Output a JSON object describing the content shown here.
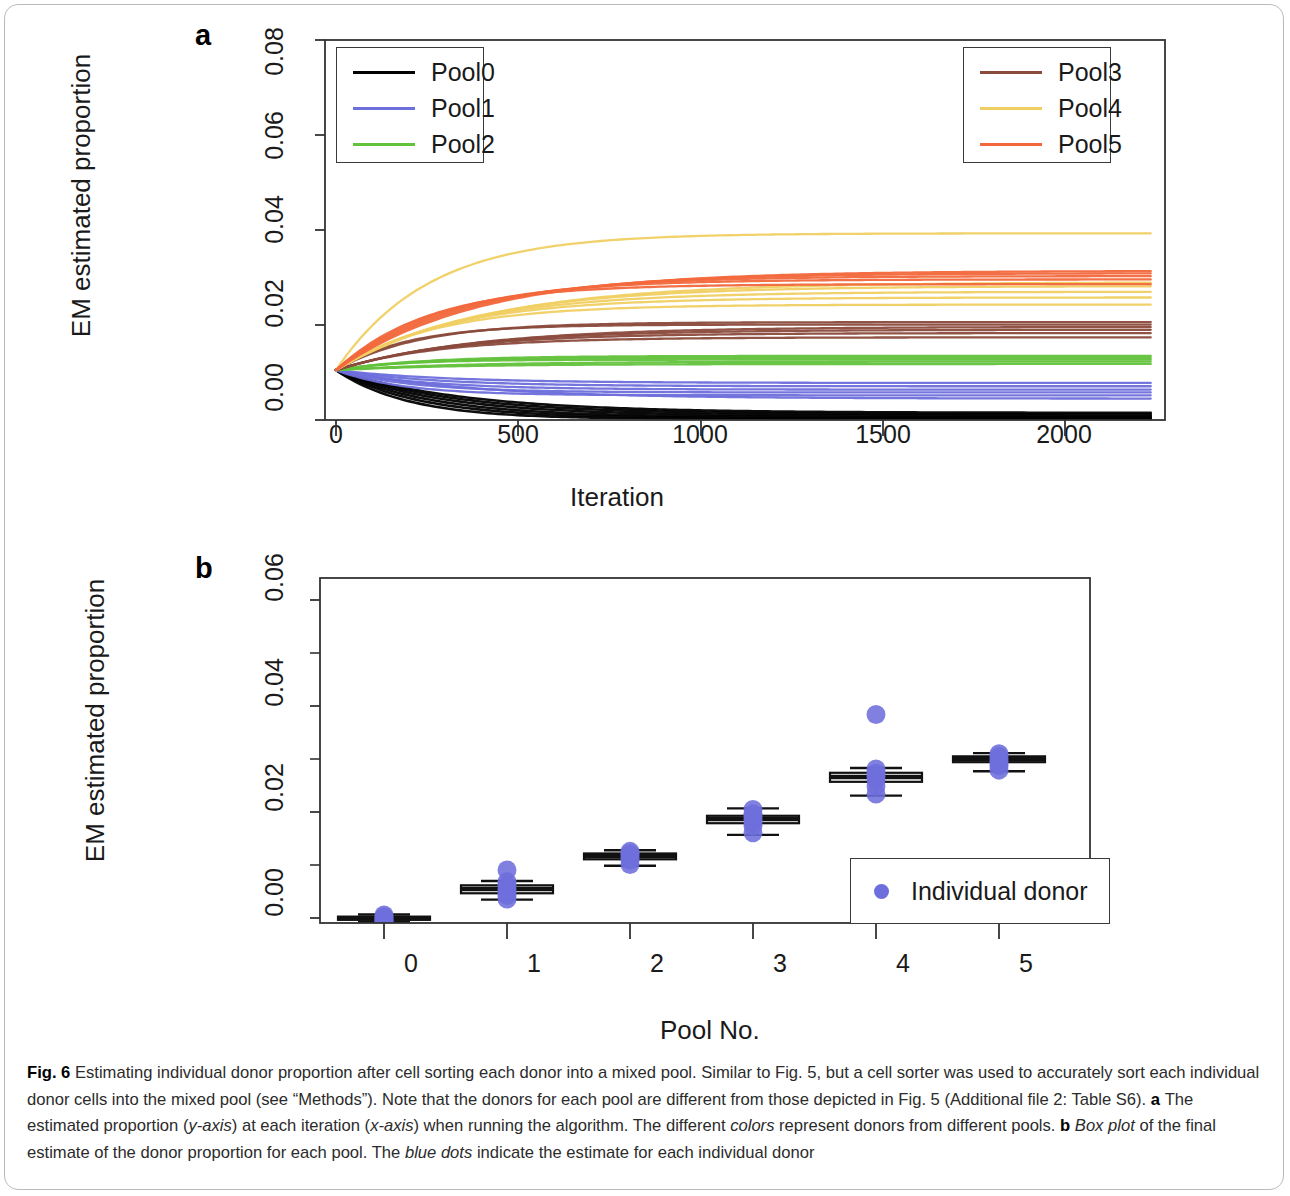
{
  "figure": {
    "label": "Fig. 6",
    "caption_parts": [
      {
        "text": "Fig. 6 ",
        "style": "bold"
      },
      {
        "text": "Estimating individual donor proportion after cell sorting each donor into a mixed pool. Similar to Fig. 5, but a cell sorter was used to accurately sort each individual donor cells into the mixed pool (see “Methods”). Note that the donors for each pool are different from those depicted in Fig. 5 (Additional file 2: Table S6). ",
        "style": "normal"
      },
      {
        "text": "a ",
        "style": "bold"
      },
      {
        "text": "The estimated proportion (",
        "style": "normal"
      },
      {
        "text": "y-axis",
        "style": "italic"
      },
      {
        "text": ") at each iteration (",
        "style": "normal"
      },
      {
        "text": "x-axis",
        "style": "italic"
      },
      {
        "text": ") when running the algorithm. The different ",
        "style": "normal"
      },
      {
        "text": "colors",
        "style": "italic"
      },
      {
        "text": " represent donors from different pools. ",
        "style": "normal"
      },
      {
        "text": "b ",
        "style": "bold"
      },
      {
        "text": "Box plot",
        "style": "italic"
      },
      {
        "text": " of the final estimate of the donor proportion for each pool. The ",
        "style": "normal"
      },
      {
        "text": "blue dots",
        "style": "italic"
      },
      {
        "text": " indicate the estimate for each individual donor",
        "style": "normal"
      }
    ],
    "caption_plain": "Fig. 6 Estimating individual donor proportion after cell sorting each donor into a mixed pool. Similar to Fig. 5, but a cell sorter was used to accurately sort each individual donor cells into the mixed pool (see “Methods”). Note that the donors for each pool are different from those depicted in Fig. 5 (Additional file 2: Table S6). a The estimated proportion (y-axis) at each iteration (x-axis) when running the algorithm. The different colors represent donors from different pools. b Box plot of the final estimate of the donor proportion for each pool. The blue dots indicate the estimate for each individual donor"
  },
  "panel_a": {
    "letter": "a",
    "legend_left": {
      "entries": [
        {
          "label": "Pool0",
          "color": "#000000"
        },
        {
          "label": "Pool1",
          "color": "#6e6edc"
        },
        {
          "label": "Pool2",
          "color": "#63c23c"
        }
      ]
    },
    "legend_right": {
      "entries": [
        {
          "label": "Pool3",
          "color": "#8a4a3c"
        },
        {
          "label": "Pool4",
          "color": "#f0cf62"
        },
        {
          "label": "Pool5",
          "color": "#f2683c"
        }
      ]
    }
  },
  "panel_b": {
    "letter": "b",
    "legend": {
      "entries": [
        {
          "label": "Individual donor",
          "color": "#6e6edc",
          "marker": "dot"
        }
      ]
    }
  },
  "chart_data": [
    {
      "type": "line",
      "panel": "a",
      "title": "",
      "xlabel": "Iteration",
      "ylabel": "EM estimated proportion",
      "xlim": [
        0,
        2000
      ],
      "ylim": [
        0.0,
        0.08
      ],
      "xticks": [
        0,
        500,
        1000,
        1500,
        2000
      ],
      "xtick_labels": [
        "0",
        "500",
        "1000",
        "1500",
        "2000"
      ],
      "yticks": [
        0.0,
        0.02,
        0.04,
        0.06,
        0.08
      ],
      "ytick_labels": [
        "0.00",
        "0.02",
        "0.04",
        "0.06",
        "0.08"
      ],
      "grid": false,
      "legend_position": "top-left and top-right",
      "start_value": 0.0105,
      "note": "All donor traces start near 0.0105 at iteration 0 and converge to their final proportion by ~iteration 600-1000",
      "series": [
        {
          "name": "Pool0 donor 1",
          "pool": "Pool0",
          "color": "#000000",
          "final": 0.0002
        },
        {
          "name": "Pool0 donor 2",
          "pool": "Pool0",
          "color": "#000000",
          "final": 0.0004
        },
        {
          "name": "Pool0 donor 3",
          "pool": "Pool0",
          "color": "#000000",
          "final": 0.0006
        },
        {
          "name": "Pool0 donor 4",
          "pool": "Pool0",
          "color": "#000000",
          "final": 0.0009
        },
        {
          "name": "Pool0 donor 5",
          "pool": "Pool0",
          "color": "#000000",
          "final": 0.0012
        },
        {
          "name": "Pool0 donor 6",
          "pool": "Pool0",
          "color": "#000000",
          "final": 0.0015
        },
        {
          "name": "Pool1 donor 1",
          "pool": "Pool1",
          "color": "#6e6edc",
          "final": 0.0045
        },
        {
          "name": "Pool1 donor 2",
          "pool": "Pool1",
          "color": "#6e6edc",
          "final": 0.0052
        },
        {
          "name": "Pool1 donor 3",
          "pool": "Pool1",
          "color": "#6e6edc",
          "final": 0.0058
        },
        {
          "name": "Pool1 donor 4",
          "pool": "Pool1",
          "color": "#6e6edc",
          "final": 0.0064
        },
        {
          "name": "Pool1 donor 5",
          "pool": "Pool1",
          "color": "#6e6edc",
          "final": 0.0071
        },
        {
          "name": "Pool1 donor 6",
          "pool": "Pool1",
          "color": "#6e6edc",
          "final": 0.0078
        },
        {
          "name": "Pool2 donor 1",
          "pool": "Pool2",
          "color": "#63c23c",
          "final": 0.0118
        },
        {
          "name": "Pool2 donor 2",
          "pool": "Pool2",
          "color": "#63c23c",
          "final": 0.0123
        },
        {
          "name": "Pool2 donor 3",
          "pool": "Pool2",
          "color": "#63c23c",
          "final": 0.0127
        },
        {
          "name": "Pool2 donor 4",
          "pool": "Pool2",
          "color": "#63c23c",
          "final": 0.0131
        },
        {
          "name": "Pool2 donor 5",
          "pool": "Pool2",
          "color": "#63c23c",
          "final": 0.0135
        },
        {
          "name": "Pool3 donor 1",
          "pool": "Pool3",
          "color": "#8a4a3c",
          "final": 0.0174
        },
        {
          "name": "Pool3 donor 2",
          "pool": "Pool3",
          "color": "#8a4a3c",
          "final": 0.0183
        },
        {
          "name": "Pool3 donor 3",
          "pool": "Pool3",
          "color": "#8a4a3c",
          "final": 0.019
        },
        {
          "name": "Pool3 donor 4",
          "pool": "Pool3",
          "color": "#8a4a3c",
          "final": 0.0196
        },
        {
          "name": "Pool3 donor 5",
          "pool": "Pool3",
          "color": "#8a4a3c",
          "final": 0.0201
        },
        {
          "name": "Pool3 donor 6",
          "pool": "Pool3",
          "color": "#8a4a3c",
          "final": 0.0206
        },
        {
          "name": "Pool4 donor 1",
          "pool": "Pool4",
          "color": "#f0cf62",
          "final": 0.0243
        },
        {
          "name": "Pool4 donor 2",
          "pool": "Pool4",
          "color": "#f0cf62",
          "final": 0.0258
        },
        {
          "name": "Pool4 donor 3",
          "pool": "Pool4",
          "color": "#f0cf62",
          "final": 0.027
        },
        {
          "name": "Pool4 donor 4",
          "pool": "Pool4",
          "color": "#f0cf62",
          "final": 0.0282
        },
        {
          "name": "Pool4 donor 5",
          "pool": "Pool4",
          "color": "#f0cf62",
          "final": 0.029
        },
        {
          "name": "Pool4 donor 6",
          "pool": "Pool4",
          "color": "#f0cf62",
          "final": 0.0393
        },
        {
          "name": "Pool5 donor 1",
          "pool": "Pool5",
          "color": "#f2683c",
          "final": 0.0286
        },
        {
          "name": "Pool5 donor 2",
          "pool": "Pool5",
          "color": "#f2683c",
          "final": 0.0296
        },
        {
          "name": "Pool5 donor 3",
          "pool": "Pool5",
          "color": "#f2683c",
          "final": 0.0303
        },
        {
          "name": "Pool5 donor 4",
          "pool": "Pool5",
          "color": "#f2683c",
          "final": 0.0309
        },
        {
          "name": "Pool5 donor 5",
          "pool": "Pool5",
          "color": "#f2683c",
          "final": 0.0314
        }
      ]
    },
    {
      "type": "box",
      "panel": "b",
      "title": "",
      "xlabel": "Pool No.",
      "ylabel": "EM estimated proportion",
      "ylim": [
        0.0,
        0.065
      ],
      "yticks": [
        0.0,
        0.02,
        0.04,
        0.06
      ],
      "ytick_labels": [
        "0.00",
        "0.02",
        "0.04",
        "0.06"
      ],
      "yticks_minor": [
        0.01,
        0.03,
        0.05
      ],
      "categories": [
        "0",
        "1",
        "2",
        "3",
        "4",
        "5"
      ],
      "grid": false,
      "legend_position": "bottom-right",
      "dot_color": "#6e6edc",
      "boxes": [
        {
          "category": "0",
          "min": 0.0002,
          "q1": 0.0006,
          "median": 0.0009,
          "q3": 0.0012,
          "max": 0.0016,
          "points": [
            0.0002,
            0.0004,
            0.0006,
            0.0009,
            0.0012,
            0.0015
          ]
        },
        {
          "category": "1",
          "min": 0.0044,
          "q1": 0.0056,
          "median": 0.0064,
          "q3": 0.0071,
          "max": 0.0079,
          "points": [
            0.0045,
            0.0052,
            0.0058,
            0.0064,
            0.0071,
            0.0078,
            0.01
          ]
        },
        {
          "category": "2",
          "min": 0.0108,
          "q1": 0.012,
          "median": 0.0126,
          "q3": 0.0131,
          "max": 0.0137,
          "points": [
            0.011,
            0.0118,
            0.0123,
            0.0127,
            0.0131,
            0.0135
          ]
        },
        {
          "category": "3",
          "min": 0.0166,
          "q1": 0.0188,
          "median": 0.0196,
          "q3": 0.0202,
          "max": 0.0216,
          "points": [
            0.017,
            0.0183,
            0.019,
            0.0196,
            0.0201,
            0.0206,
            0.0214
          ]
        },
        {
          "category": "4",
          "min": 0.024,
          "q1": 0.0266,
          "median": 0.0275,
          "q3": 0.0283,
          "max": 0.0292,
          "points": [
            0.0243,
            0.0258,
            0.027,
            0.0276,
            0.0282,
            0.029
          ],
          "outliers": [
            0.0393
          ]
        },
        {
          "category": "5",
          "min": 0.0286,
          "q1": 0.0303,
          "median": 0.0309,
          "q3": 0.0314,
          "max": 0.032,
          "points": [
            0.0288,
            0.0296,
            0.0303,
            0.0309,
            0.0314,
            0.0319
          ]
        }
      ]
    }
  ]
}
